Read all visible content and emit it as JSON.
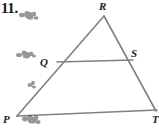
{
  "figure": {
    "problem_number": "11.",
    "shape": "triangle",
    "line_color": "#808080",
    "label_color": "#1c1c1c",
    "background_color": "#ffffff",
    "vertices": [
      {
        "id": "R",
        "label": "R",
        "x": 104,
        "y": 16,
        "role": "apex"
      },
      {
        "id": "P",
        "label": "P",
        "x": 17,
        "y": 116,
        "role": "bottom-left"
      },
      {
        "id": "T",
        "label": "T",
        "x": 155,
        "y": 110,
        "role": "bottom-right-cropped"
      }
    ],
    "points": [
      {
        "id": "Q",
        "label": "Q",
        "x": 57,
        "y": 62,
        "on_segment": "PR"
      },
      {
        "id": "S",
        "label": "S",
        "x": 132,
        "y": 60,
        "on_segment": "RT"
      }
    ],
    "segments": [
      {
        "name": "RP",
        "from": "R",
        "to": "P"
      },
      {
        "name": "RT",
        "from": "R",
        "to": "T"
      },
      {
        "name": "PT",
        "from": "P",
        "to": "T"
      },
      {
        "name": "QS",
        "from": "Q",
        "to": "S"
      }
    ],
    "smudges": [
      {
        "id": "smudge-top",
        "x": 18,
        "y": 10,
        "width": 22,
        "height": 12
      },
      {
        "id": "smudge-mid-left",
        "x": 15,
        "y": 49,
        "width": 22,
        "height": 11
      },
      {
        "id": "smudge-on-side",
        "x": 26,
        "y": 80,
        "width": 12,
        "height": 12
      },
      {
        "id": "smudge-bottom",
        "x": 20,
        "y": 114,
        "width": 22,
        "height": 12
      }
    ]
  }
}
